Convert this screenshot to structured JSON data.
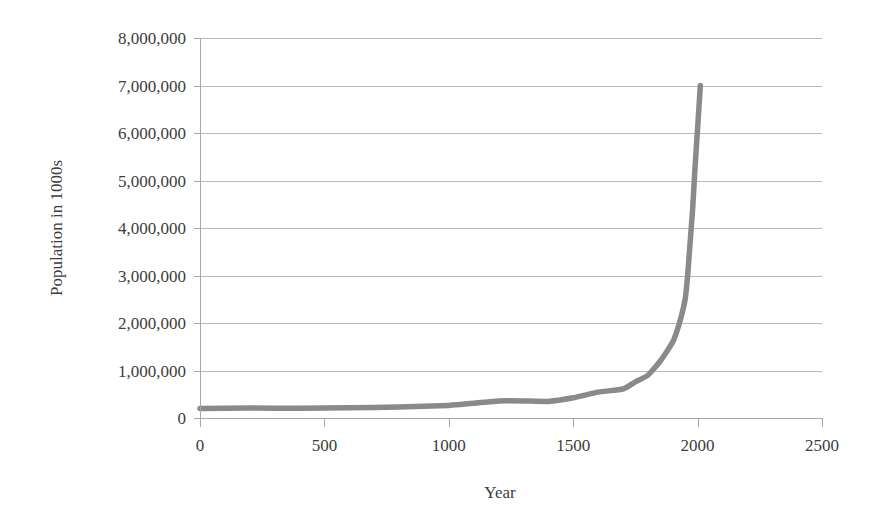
{
  "chart_data": {
    "type": "line",
    "title": "",
    "xlabel": "Year",
    "ylabel": "Population in 1000s",
    "xlim": [
      0,
      2500
    ],
    "ylim": [
      0,
      8000000
    ],
    "grid": true,
    "legend": false,
    "legend_position": "none",
    "series_color": "#8a8a8a",
    "gridline_color": "#b9b9b9",
    "axis_color": "#a8a8a8",
    "background_color": "#ffffff",
    "x_ticks": [
      0,
      500,
      1000,
      1500,
      2000,
      2500
    ],
    "x_tick_labels": [
      "0",
      "500",
      "1000",
      "1500",
      "2000",
      "2500"
    ],
    "y_ticks": [
      0,
      1000000,
      2000000,
      3000000,
      4000000,
      5000000,
      6000000,
      7000000,
      8000000
    ],
    "y_tick_labels": [
      "0",
      "1,000,000",
      "2,000,000",
      "3,000,000",
      "4,000,000",
      "5,000,000",
      "6,000,000",
      "7,000,000",
      "8,000,000"
    ],
    "series": [
      {
        "name": "World population",
        "x": [
          0,
          200,
          400,
          600,
          800,
          1000,
          1100,
          1200,
          1300,
          1400,
          1500,
          1600,
          1700,
          1750,
          1800,
          1850,
          1900,
          1927,
          1950,
          1960,
          1970,
          1980,
          1990,
          2000,
          2011
        ],
        "values": [
          200000,
          210000,
          205000,
          215000,
          230000,
          265000,
          310000,
          360000,
          360000,
          350000,
          425000,
          545000,
          610000,
          760000,
          900000,
          1200000,
          1600000,
          2000000,
          2500000,
          3000000,
          3700000,
          4400000,
          5300000,
          6100000,
          7000000
        ]
      }
    ]
  },
  "axes": {
    "x_axis_title": "Year",
    "y_axis_title": "Population in 1000s"
  }
}
